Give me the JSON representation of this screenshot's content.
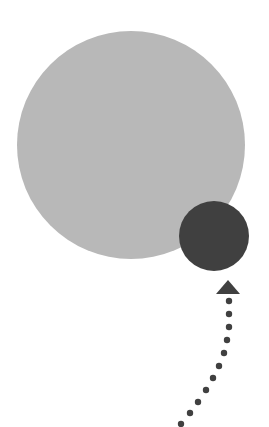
{
  "diagram": {
    "background": "#ffffff",
    "large_circle": {
      "cx": 131,
      "cy": 145,
      "r": 114,
      "color": "#b8b8b8"
    },
    "small_circle": {
      "cx": 214,
      "cy": 236,
      "r": 35,
      "color": "#404040"
    },
    "arrow": {
      "color": "#404040",
      "head": {
        "points": "228,280 216,294 240,294"
      },
      "dots": [
        [
          229,
          301
        ],
        [
          229,
          314
        ],
        [
          229,
          327
        ],
        [
          227,
          340
        ],
        [
          224,
          353
        ],
        [
          219,
          366
        ],
        [
          213,
          378
        ],
        [
          206,
          390
        ],
        [
          198,
          402
        ],
        [
          190,
          413
        ],
        [
          181,
          424
        ]
      ],
      "dot_radius": 3.2
    }
  }
}
